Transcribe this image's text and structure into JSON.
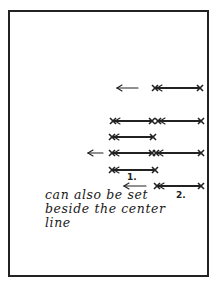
{
  "diagram": {
    "frame": {
      "stroke": "#222222"
    },
    "rows": [
      {
        "y": 88,
        "arrow": {
          "x1": 138,
          "x2": 117
        },
        "segments": [
          [
            155,
            200
          ]
        ]
      },
      {
        "y": 121,
        "arrow": null,
        "segments": [
          [
            113,
            152
          ],
          [
            158,
            201
          ]
        ]
      },
      {
        "y": 137,
        "arrow": null,
        "segments": [
          [
            112,
            153
          ]
        ]
      },
      {
        "y": 153,
        "arrow": {
          "x1": 103,
          "x2": 88
        },
        "segments": [
          [
            112,
            152
          ],
          [
            156,
            201
          ]
        ]
      },
      {
        "y": 170,
        "arrow": null,
        "segments": [
          [
            112,
            155
          ]
        ]
      },
      {
        "y": 186,
        "arrow": {
          "x1": 146,
          "x2": 124
        },
        "segments": [
          [
            157,
            201
          ]
        ]
      }
    ],
    "labels": [
      {
        "text": "1.",
        "x": 127,
        "y": 172
      },
      {
        "text": "2.",
        "x": 176,
        "y": 190
      }
    ],
    "note_lines": [
      "can also be set",
      "beside the center",
      "line"
    ]
  }
}
